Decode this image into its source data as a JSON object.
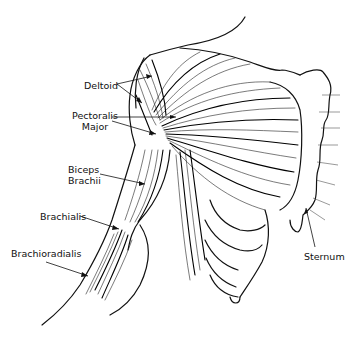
{
  "diagram": {
    "type": "anatomical-line-drawing",
    "labels": [
      {
        "id": "deltoid",
        "text": "Deltoid",
        "x": 84,
        "y": 80
      },
      {
        "id": "pectoralis-major",
        "lines": [
          "Pectoralis",
          "Major"
        ],
        "x": 72,
        "y": 110
      },
      {
        "id": "biceps-brachii",
        "lines": [
          "Biceps",
          "Brachii"
        ],
        "x": 68,
        "y": 164
      },
      {
        "id": "brachialis",
        "text": "Brachialis",
        "x": 40,
        "y": 211
      },
      {
        "id": "brachioradialis",
        "text": "Brachioradialis",
        "x": 11,
        "y": 248
      },
      {
        "id": "sternum",
        "text": "Sternum",
        "x": 304,
        "y": 251
      }
    ]
  }
}
